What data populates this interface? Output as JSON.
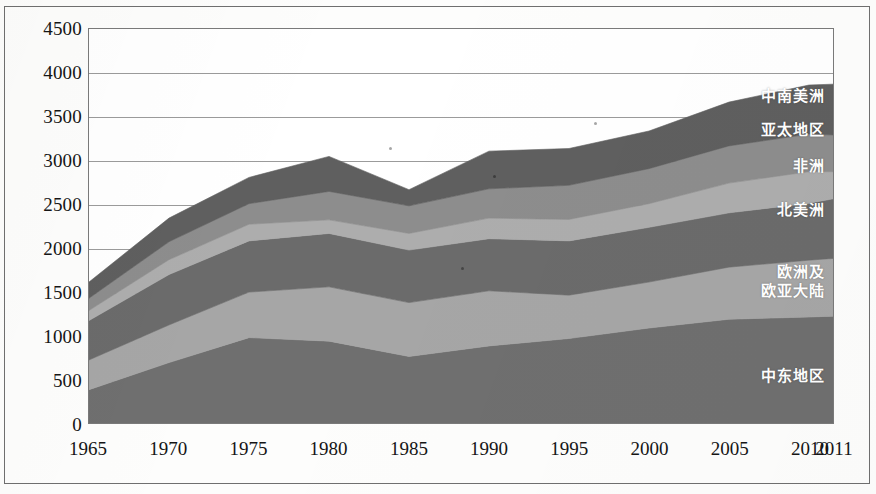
{
  "chart_data": {
    "type": "area",
    "stacked": true,
    "title": "",
    "subtitle": "",
    "xlabel": "",
    "ylabel": "",
    "x": [
      1965,
      1970,
      1975,
      1980,
      1985,
      1990,
      1995,
      2000,
      2005,
      2010,
      2011
    ],
    "xtick_labels": [
      "1965",
      "1970",
      "1975",
      "1980",
      "1985",
      "1990",
      "1995",
      "2000",
      "2005",
      "2010",
      "2011"
    ],
    "ytick_labels": [
      "4500",
      "4000",
      "3500",
      "3000",
      "2500",
      "2000",
      "1500",
      "1000",
      "500",
      "0"
    ],
    "ylim": [
      0,
      4500
    ],
    "ytick_step": 500,
    "grid": true,
    "legend_position": "inline-right",
    "series": [
      {
        "name": "中东地区",
        "color": "#6f6f6f",
        "values": [
          380,
          690,
          975,
          935,
          760,
          880,
          965,
          1085,
          1185,
          1210,
          1220
        ]
      },
      {
        "name": "欧洲及欧亚大陆",
        "color": "#a6a6a6",
        "values": [
          340,
          430,
          520,
          620,
          615,
          630,
          495,
          525,
          595,
          650,
          660
        ]
      },
      {
        "name": "北美洲",
        "color": "#6b6b6b",
        "values": [
          450,
          575,
          585,
          610,
          600,
          595,
          620,
          625,
          620,
          650,
          680
        ]
      },
      {
        "name": "非洲",
        "color": "#adadad",
        "values": [
          115,
          170,
          190,
          155,
          190,
          235,
          245,
          270,
          340,
          360,
          310
        ]
      },
      {
        "name": "亚太地区",
        "color": "#8d8d8d",
        "values": [
          140,
          205,
          235,
          325,
          315,
          335,
          390,
          400,
          425,
          430,
          420
        ]
      },
      {
        "name": "中南美洲",
        "color": "#5f5f5f",
        "values": [
          185,
          270,
          300,
          400,
          185,
          430,
          420,
          430,
          500,
          560,
          580
        ]
      }
    ],
    "totals": [
      1610,
      2340,
      2805,
      3045,
      2665,
      3105,
      3135,
      3335,
      3665,
      3860,
      3870
    ]
  },
  "labels": {
    "central_south_america": "中南美洲",
    "asia_pacific": "亚太地区",
    "africa": "非洲",
    "north_america": "北美洲",
    "europe_eurasia": "欧洲及\n欧亚大陆",
    "middle_east": "中东地区"
  }
}
